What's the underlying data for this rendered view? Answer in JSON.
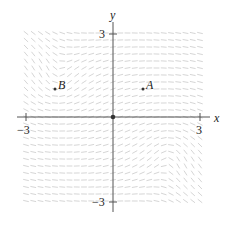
{
  "figure": {
    "type": "direction field",
    "axis_labels": {
      "x": "x",
      "y": "y"
    },
    "ticks": {
      "x_neg": "−3",
      "x_pos": "3",
      "y_pos": "3",
      "y_neg": "−3"
    },
    "range": {
      "xmin": -3,
      "xmax": 3,
      "ymin": -3,
      "ymax": 3
    },
    "points": [
      {
        "label": "A",
        "x": 1,
        "y": 1
      },
      {
        "label": "B",
        "x": -2,
        "y": 1
      },
      {
        "label": "",
        "x": 0,
        "y": 0,
        "note": "origin dot"
      }
    ],
    "colors": {
      "axis": "#555555",
      "field": "#d0d0d0",
      "point": "#333333",
      "text": "#222222"
    },
    "field_grid": {
      "step": 0.25,
      "segment_half_length": 0.1
    },
    "vortex_centers": [
      {
        "x": -2,
        "y": 1
      },
      {
        "x": 2,
        "y": -1
      }
    ]
  }
}
